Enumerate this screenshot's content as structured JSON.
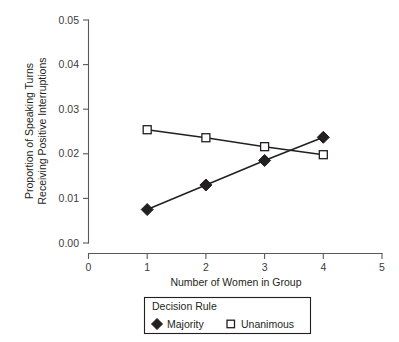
{
  "chart_data": {
    "type": "line",
    "title": "",
    "xlabel": "Number of Women in Group",
    "ylabel_line1": "Proportion of Speaking Turns",
    "ylabel_line2": "Receiving Positive Interruptions",
    "x": [
      1,
      2,
      3,
      4
    ],
    "xlim": [
      0,
      5
    ],
    "ylim": [
      0.0,
      0.05
    ],
    "xticks": [
      "0",
      "1",
      "2",
      "3",
      "4",
      "5"
    ],
    "xtick_values": [
      0,
      1,
      2,
      3,
      4,
      5
    ],
    "yticks": [
      "0.00",
      "0.01",
      "0.02",
      "0.03",
      "0.04",
      "0.05"
    ],
    "ytick_values": [
      0.0,
      0.01,
      0.02,
      0.03,
      0.04,
      0.05
    ],
    "grid": false,
    "legend_position": "below-plot",
    "legend_title": "Decision Rule",
    "series": [
      {
        "name": "Majority",
        "marker": "filled-diamond",
        "color": "#231f20",
        "values": [
          0.0075,
          0.013,
          0.0185,
          0.0237
        ]
      },
      {
        "name": "Unanimous",
        "marker": "open-square",
        "color": "#231f20",
        "values": [
          0.0254,
          0.0236,
          0.0216,
          0.0198
        ]
      }
    ]
  },
  "axes": {
    "x_title": "Number of Women in Group",
    "y_title_line1": "Proportion of Speaking Turns",
    "y_title_line2": "Receiving Positive Interruptions"
  },
  "legend": {
    "title": "Decision Rule",
    "entries": [
      {
        "label": "Majority",
        "marker": "filled-diamond-icon"
      },
      {
        "label": "Unanimous",
        "marker": "open-square-icon"
      }
    ]
  },
  "ticks": {
    "x": [
      "0",
      "1",
      "2",
      "3",
      "4",
      "5"
    ],
    "y": [
      "0.00",
      "0.01",
      "0.02",
      "0.03",
      "0.04",
      "0.05"
    ]
  },
  "colors": {
    "series": "#231f20",
    "axis": "#58595b",
    "background": "#ffffff"
  }
}
